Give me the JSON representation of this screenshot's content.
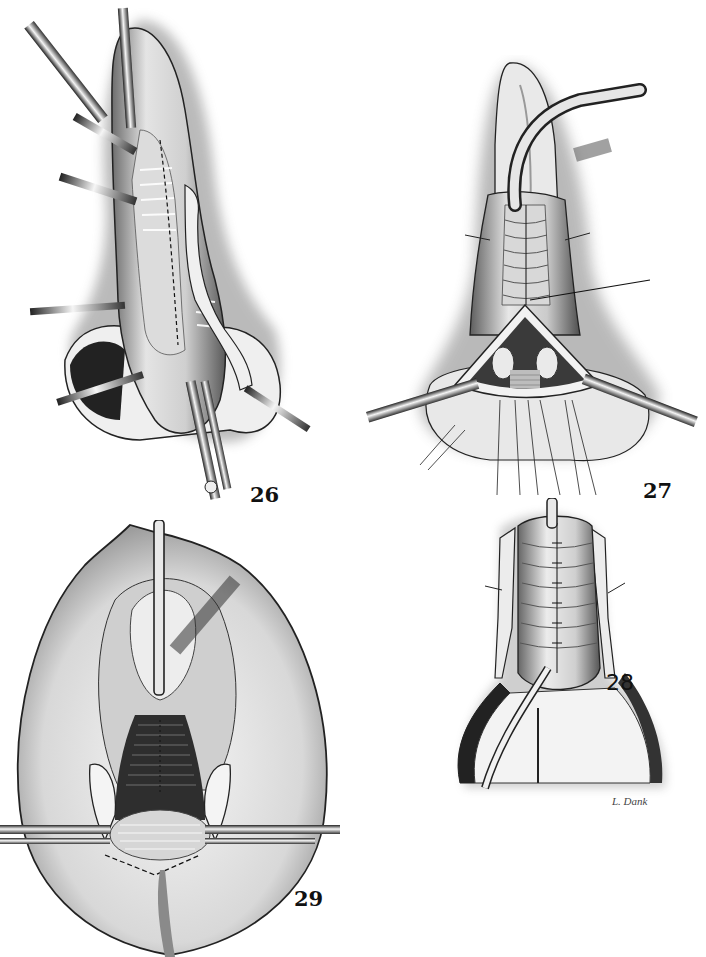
{
  "plate": {
    "background": "#ffffff",
    "ink_color": "#111111",
    "figures": [
      {
        "id": "26",
        "label": "26",
        "subject": "surgical illustration with retractors and dashed incision line"
      },
      {
        "id": "27",
        "label": "27",
        "subject": "surgical illustration with catheter, retractors and sutures"
      },
      {
        "id": "28",
        "label": "28",
        "subject": "surgical illustration of sutured repair with drain"
      },
      {
        "id": "29",
        "label": "29",
        "subject": "surgical illustration with catheter and horizontal retractors"
      }
    ],
    "signature": "L. Dank"
  }
}
